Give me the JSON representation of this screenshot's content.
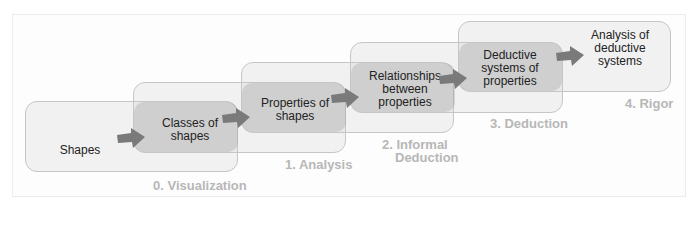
{
  "diagram": {
    "colors": {
      "box_fill": "#e9e9e9",
      "overlap_fill": "#bdbdbd",
      "arrow": "#777777",
      "level_label": "#b7b7b7",
      "text": "#222222"
    },
    "levels": [
      {
        "label": "0. Visualization",
        "content": "Shapes"
      },
      {
        "label": "1. Analysis",
        "content": "Classes of shapes"
      },
      {
        "label": "2. Informal Deduction",
        "content": "Properties of shapes"
      },
      {
        "label": "3. Deduction",
        "content": "Relationships between properties"
      },
      {
        "label": "4. Rigor",
        "content": "Deductive systems of properties"
      }
    ],
    "final_content": "Analysis of deductive systems",
    "text_lines": {
      "shapes": "Shapes",
      "classes_1": "Classes of",
      "classes_2": "shapes",
      "props_1": "Properties of",
      "props_2": "shapes",
      "rel_1": "Relationships",
      "rel_2": "between",
      "rel_3": "properties",
      "ded_1": "Deductive",
      "ded_2": "systems of",
      "ded_3": "properties",
      "ana_1": "Analysis of",
      "ana_2": "deductive",
      "ana_3": "systems"
    },
    "level_labels": {
      "l0": "0. Visualization",
      "l1": "1. Analysis",
      "l2a": "2. Informal",
      "l2b": "Deduction",
      "l3": "3. Deduction",
      "l4": "4. Rigor"
    }
  }
}
